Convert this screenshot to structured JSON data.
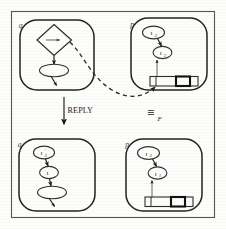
{
  "figure": {
    "kind": "actor-configuration-transition-diagram",
    "transition_label": "REPLY",
    "equivalence_symbol": "≡",
    "equivalence_subscript": "F",
    "panels": [
      {
        "id": "top-left",
        "corner_label": "q",
        "role": "source-configuration-with-reply-redex",
        "nodes": [
          {
            "id": "tl-diamond",
            "shape": "diamond",
            "label": "→",
            "label_kind": "arrow-glyph"
          },
          {
            "id": "tl-ellipse",
            "shape": "ellipse",
            "label": "",
            "label_kind": "blank"
          }
        ],
        "edges": [
          {
            "from": "tl-diamond",
            "to": "tl-ellipse",
            "style": "solid-arrow"
          },
          {
            "from": "tl-ellipse",
            "to": "tl-outgoing",
            "style": "solid-arrow-tail"
          }
        ],
        "queue": null
      },
      {
        "id": "top-right",
        "corner_label": "p",
        "role": "target-configuration-with-message-queue",
        "nodes": [
          {
            "id": "tr-iota2",
            "shape": "ellipse",
            "label": "ι",
            "subscript": "2",
            "prime": false
          },
          {
            "id": "tr-iota1",
            "shape": "ellipse",
            "label": "ι",
            "subscript": "1",
            "prime": false
          }
        ],
        "edges": [
          {
            "from": "tr-iota2",
            "to": "tr-iota1",
            "style": "solid-arrow"
          },
          {
            "from": "tr-queue",
            "to": "tr-iota1",
            "style": "solid-arrow-up"
          }
        ],
        "queue": {
          "cell_count": 4,
          "marked_cell_index": 2,
          "marked_cell_note": "highlighted-slot"
        }
      },
      {
        "id": "bottom-left",
        "corner_label": "q",
        "role": "result-configuration-after-reply",
        "nodes": [
          {
            "id": "bl-iota2p",
            "shape": "ellipse",
            "label": "ι",
            "subscript": "2",
            "prime": true
          },
          {
            "id": "bl-iota",
            "shape": "ellipse",
            "label": "ι",
            "subscript": "",
            "prime": false
          },
          {
            "id": "bl-ellipse",
            "shape": "ellipse",
            "label": "",
            "label_kind": "blank"
          }
        ],
        "edges": [
          {
            "from": "bl-iota2p",
            "to": "bl-iota",
            "style": "solid-arrow"
          },
          {
            "from": "bl-iota",
            "to": "bl-ellipse",
            "style": "solid-arrow"
          },
          {
            "from": "bl-ellipse",
            "to": "bl-outgoing",
            "style": "solid-arrow-tail"
          }
        ],
        "queue": null
      },
      {
        "id": "bottom-right",
        "corner_label": "p",
        "role": "result-configuration-equivalent-form",
        "nodes": [
          {
            "id": "br-iota2",
            "shape": "ellipse",
            "label": "ι",
            "subscript": "2",
            "prime": false
          },
          {
            "id": "br-iota1",
            "shape": "ellipse",
            "label": "ι",
            "subscript": "1",
            "prime": false
          }
        ],
        "edges": [
          {
            "from": "br-iota2",
            "to": "br-iota1",
            "style": "solid-arrow"
          },
          {
            "from": "br-queue",
            "to": "br-iota1",
            "style": "solid-arrow-up"
          }
        ],
        "queue": {
          "cell_count": 4,
          "marked_cell_index": 2,
          "marked_cell_note": "highlighted-slot"
        }
      }
    ],
    "connectors": [
      {
        "id": "dashed-link",
        "style": "dashed-curve-with-arrowhead",
        "from_panel": "top-left",
        "to_panel": "top-right",
        "note": "links redex diamond to queue slot"
      },
      {
        "id": "reply-arrow",
        "style": "solid-down-arrow",
        "label": "REPLY"
      }
    ],
    "colors": {
      "ink": "#242424",
      "frame": "#56564f",
      "paper": "#fdfdfb",
      "marked_cell": "#111111"
    }
  }
}
